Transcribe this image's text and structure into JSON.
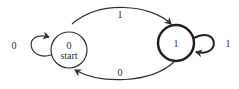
{
  "diagram": {
    "type": "finite-state-automaton",
    "states": [
      {
        "id": "0",
        "label": "0",
        "sublabel": "start",
        "accepting": false
      },
      {
        "id": "1",
        "label": "1",
        "sublabel": "",
        "accepting": true
      }
    ],
    "transitions": [
      {
        "from": "0",
        "to": "0",
        "label": "0"
      },
      {
        "from": "0",
        "to": "1",
        "label": "1"
      },
      {
        "from": "1",
        "to": "1",
        "label": "1"
      },
      {
        "from": "1",
        "to": "0",
        "label": "0"
      }
    ],
    "colors": {
      "stroke": "#333333",
      "background": "#ffffff"
    }
  }
}
